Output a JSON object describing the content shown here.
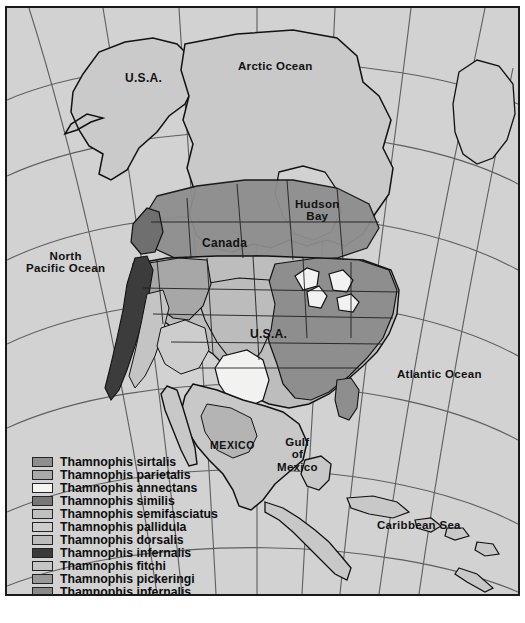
{
  "map": {
    "title": "Thamnophis species distribution map of North America",
    "background_color": "#d2d2d2",
    "frame_color": "#1a1a1a",
    "labels": [
      {
        "name": "label-arctic-ocean",
        "text": "Arctic Ocean",
        "x": 231,
        "y": 52,
        "cls": "lbl-ocean"
      },
      {
        "name": "label-usa-alaska",
        "text": "U.S.A.",
        "x": 118,
        "y": 64,
        "cls": "lbl-country"
      },
      {
        "name": "label-hudson-bay",
        "text": "Hudson\nBay",
        "x": 288,
        "y": 190,
        "cls": "lbl-ocean lbl-center"
      },
      {
        "name": "label-north-pacific-ocean",
        "text": "North\nPacific Ocean",
        "x": 19,
        "y": 242,
        "cls": "lbl-ocean lbl-center"
      },
      {
        "name": "label-canada",
        "text": "Canada",
        "x": 195,
        "y": 229,
        "cls": "lbl-country"
      },
      {
        "name": "label-usa-mainland",
        "text": "U.S.A.",
        "x": 243,
        "y": 320,
        "cls": "lbl-country"
      },
      {
        "name": "label-atlantic-ocean",
        "text": "Atlantic Ocean",
        "x": 390,
        "y": 360,
        "cls": "lbl-ocean"
      },
      {
        "name": "label-mexico",
        "text": "MEXICO",
        "x": 203,
        "y": 432,
        "cls": "lbl-mexico"
      },
      {
        "name": "label-gulf-of-mexico",
        "text": "Gulf\nof\nMexico",
        "x": 270,
        "y": 428,
        "cls": "lbl-ocean lbl-center"
      },
      {
        "name": "label-caribbean-sea",
        "text": "Caribbean Sea",
        "x": 370,
        "y": 511,
        "cls": "lbl-ocean"
      }
    ]
  },
  "legend": {
    "entries": [
      {
        "label": "Thamnophis sirtalis",
        "color": "#8e8e8e"
      },
      {
        "label": "Thamnophis parietalis",
        "color": "#a9a9a9"
      },
      {
        "label": "Thamnophis annectans",
        "color": "#f4f4f2"
      },
      {
        "label": "Thamnophis similis",
        "color": "#777777"
      },
      {
        "label": "Thamnophis semifasciatus",
        "color": "#c0c0c0"
      },
      {
        "label": "Thamnophis pallidula",
        "color": "#cdcdcd"
      },
      {
        "label": "Thamnophis dorsalis",
        "color": "#bcbcbc"
      },
      {
        "label": "Thamnophis infernalis",
        "color": "#3a3a3a"
      },
      {
        "label": "Thamnophis fitchi",
        "color": "#c6c6c6"
      },
      {
        "label": "Thamnophis pickeringi",
        "color": "#989898"
      },
      {
        "label": "Thamnophis infernalis",
        "color": "#8a8a8a"
      }
    ]
  }
}
